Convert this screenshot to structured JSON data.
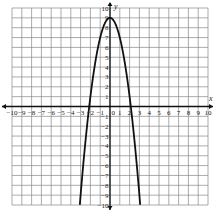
{
  "chart_data": {
    "type": "line",
    "title": "",
    "xlabel": "x",
    "ylabel": "y",
    "xlim": [
      -10,
      10
    ],
    "ylim": [
      -10,
      10
    ],
    "grid": true,
    "x_ticks": [
      -10,
      -9,
      -8,
      -7,
      -6,
      -5,
      -4,
      -3,
      -2,
      -1,
      0,
      1,
      2,
      3,
      4,
      5,
      6,
      7,
      8,
      9,
      10
    ],
    "y_ticks": [
      -10,
      -9,
      -8,
      -7,
      -6,
      -5,
      -4,
      -3,
      -2,
      -1,
      1,
      2,
      3,
      4,
      5,
      6,
      7,
      8,
      9,
      10
    ],
    "series": [
      {
        "name": "parabola",
        "equation": "y = -2x^2 + 9",
        "vertex": [
          0,
          9
        ],
        "x_intercepts": [
          -2.12,
          2.12
        ],
        "x": [
          -3.08,
          -3,
          -2.5,
          -2,
          -1.5,
          -1,
          -0.5,
          0,
          0.5,
          1,
          1.5,
          2,
          2.5,
          3,
          3.08
        ],
        "y": [
          -10,
          -9,
          -3.5,
          1,
          4.5,
          7,
          8.5,
          9,
          8.5,
          7,
          4.5,
          1,
          -3.5,
          -9,
          -10
        ]
      }
    ]
  },
  "labels": {
    "x_axis": "x",
    "y_axis": "y",
    "origin": "0"
  }
}
